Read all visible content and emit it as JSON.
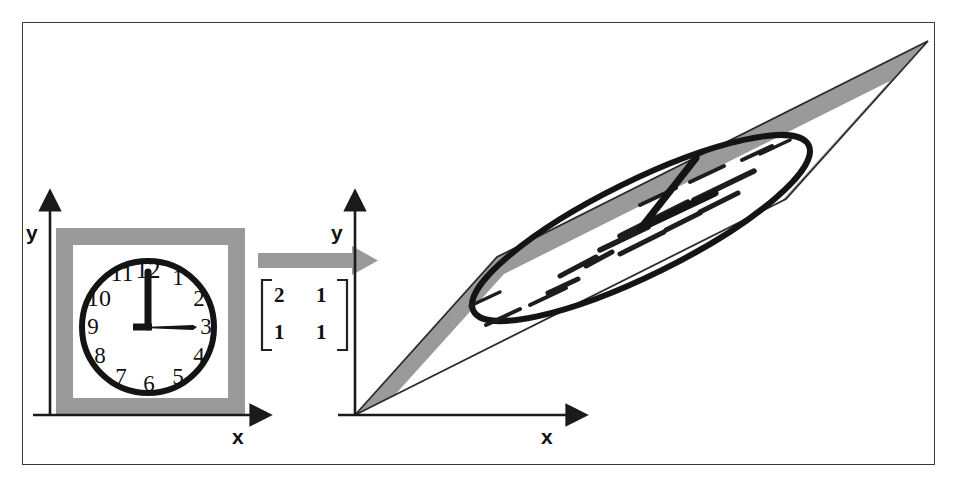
{
  "figure": {
    "frame_color": "#3a3a3a",
    "background": "#ffffff",
    "ink_color": "#111111",
    "gray_color": "#9a9a9a"
  },
  "left_panel": {
    "name": "original-clock-panel",
    "axes": {
      "y_label": "y",
      "x_label": "x",
      "origin": [
        50,
        415
      ]
    },
    "frame_square": {
      "fill": "#9a9a9a",
      "inner_fill": "#ffffff"
    },
    "clock": {
      "time_display": "3:00",
      "hour_hand_points_to": "3",
      "minute_hand_points_to": "12",
      "numerals": [
        "1",
        "2",
        "3",
        "4",
        "5",
        "6",
        "7",
        "8",
        "9",
        "10",
        "11",
        "12"
      ]
    }
  },
  "operator": {
    "name": "transformation-arrow",
    "arrow_color": "#9a9a9a",
    "matrix": {
      "rows": [
        [
          "2",
          "1"
        ],
        [
          "1",
          "1"
        ]
      ],
      "left_bracket": "[",
      "right_bracket": "]"
    }
  },
  "right_panel": {
    "name": "transformed-clock-panel",
    "axes": {
      "y_label": "y",
      "x_label": "x",
      "origin": [
        355,
        415
      ]
    },
    "description": "sheared parallelogram containing sheared clock ellipse"
  }
}
